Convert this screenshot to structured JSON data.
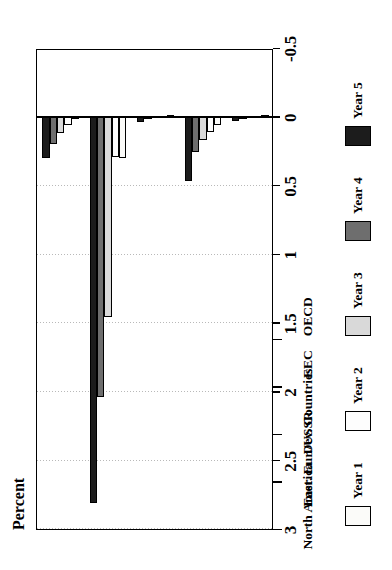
{
  "chart_data": {
    "type": "bar",
    "orientation": "horizontal-rotated",
    "title": "",
    "xlabel": "",
    "ylabel": "Percent",
    "axis_title": "Percent",
    "categories": [
      "OECD",
      "EEC",
      "Dev. Countries",
      "East. Eur./USSR",
      "North America"
    ],
    "series": [
      {
        "name": "Year 1",
        "values": [
          0.005,
          0.06,
          0.005,
          0.3,
          0.02
        ],
        "color": "#fbfbf9"
      },
      {
        "name": "Year 2",
        "values": [
          0.008,
          0.11,
          0.008,
          0.29,
          0.06
        ],
        "color": "#fdfdfd"
      },
      {
        "name": "Year 3",
        "values": [
          0.012,
          0.17,
          0.012,
          1.46,
          0.12
        ],
        "color": "#d9d9d9"
      },
      {
        "name": "Year 4",
        "values": [
          0.02,
          0.26,
          0.02,
          2.04,
          0.2
        ],
        "color": "#6e6e6e"
      },
      {
        "name": "Year 5",
        "values": [
          0.03,
          0.47,
          0.04,
          2.81,
          0.3
        ],
        "color": "#1c1c1c"
      }
    ],
    "value_ticks": [
      "3",
      "2.5",
      "2",
      "1.5",
      "1",
      "0.5",
      "0",
      "-0.5"
    ],
    "value_tick_numbers": [
      3,
      2.5,
      2,
      1.5,
      1,
      0.5,
      0,
      -0.5
    ],
    "ylim": [
      -0.5,
      3
    ],
    "grid": true,
    "grid_axis": "value",
    "legend_position": "bottom",
    "legend": [
      "Year 1",
      "Year 2",
      "Year 3",
      "Year 4",
      "Year 5"
    ]
  }
}
